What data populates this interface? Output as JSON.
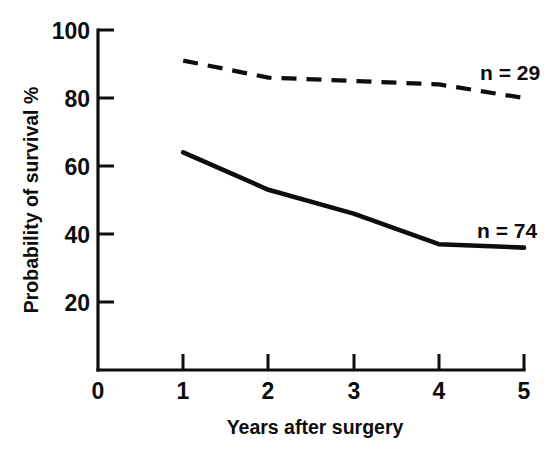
{
  "chart_data": {
    "type": "line",
    "title": "",
    "subtitle": "",
    "xlabel": "Years after surgery",
    "ylabel": "Probability of survival %",
    "xlim": [
      0,
      5
    ],
    "ylim": [
      0,
      100
    ],
    "grid": false,
    "legend_position": "inline-right-of-series",
    "x": [
      1,
      2,
      3,
      4,
      5
    ],
    "xticklabels": [
      "0",
      "1",
      "2",
      "3",
      "4",
      "5"
    ],
    "xticks": [
      0,
      1,
      2,
      3,
      4,
      5
    ],
    "yticks": [
      20,
      40,
      60,
      80,
      100
    ],
    "yticklabels": [
      "20",
      "40",
      "60",
      "80",
      "100"
    ],
    "series": [
      {
        "name": "n = 29",
        "style": "dashed",
        "annotation": "n = 29",
        "values": [
          91,
          86,
          85,
          84,
          80
        ]
      },
      {
        "name": "n = 74",
        "style": "solid",
        "annotation": "n = 74",
        "values": [
          64,
          53,
          46,
          37,
          36
        ]
      }
    ],
    "annotations": [
      {
        "text": "n = 29",
        "x": 4.55,
        "y": 88
      },
      {
        "text": "n = 74",
        "x": 4.5,
        "y": 42
      }
    ],
    "colors": {
      "ink": "#0d0d0d",
      "background": "#ffffff"
    }
  },
  "axis": {
    "y_labels": {
      "t100": "100",
      "t80": "80",
      "t60": "60",
      "t40": "40",
      "t20": "20"
    },
    "x_labels": {
      "t0": "0",
      "t1": "1",
      "t2": "2",
      "t3": "3",
      "t4": "4",
      "t5": "5"
    },
    "x_title": "Years after surgery",
    "y_title": "Probability of survival %"
  },
  "series_labels": {
    "upper": "n = 29",
    "lower": "n = 74"
  }
}
